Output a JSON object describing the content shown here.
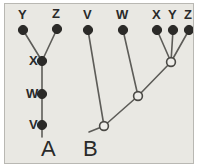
{
  "figure": {
    "background_color": "#e9e8e3",
    "border_color": "#b9b8b3",
    "line_color": "#5d5c58",
    "filled_node_color": "#2b2a28",
    "open_node_fill": "#eeede9",
    "text_color": "#2a2a2a"
  },
  "panels": [
    {
      "id": "A",
      "label": "A",
      "label_pos": {
        "x": 36,
        "y": 152
      },
      "type": "ladder-tree-filled-nodes",
      "tips": [
        {
          "name": "Y",
          "label": "Y",
          "x": 18,
          "y": 26,
          "label_x": 13,
          "label_y": 15,
          "node": "filled"
        },
        {
          "name": "Z",
          "label": "Z",
          "x": 52,
          "y": 25,
          "label_x": 47,
          "label_y": 14,
          "node": "filled"
        }
      ],
      "internal_nodes": [
        {
          "name": "X",
          "label": "X",
          "x": 37,
          "y": 57,
          "label_x": 24,
          "label_y": 61,
          "node": "filled"
        },
        {
          "name": "W",
          "label": "W",
          "x": 37,
          "y": 90,
          "label_x": 21,
          "label_y": 94,
          "node": "filled"
        },
        {
          "name": "V",
          "label": "V",
          "x": 37,
          "y": 121,
          "label_x": 24,
          "label_y": 125,
          "node": "filled"
        }
      ],
      "branches": [
        {
          "from": "Y",
          "to": "X",
          "x1": 18,
          "y1": 26,
          "x2": 37,
          "y2": 57
        },
        {
          "from": "Z",
          "to": "X",
          "x1": 52,
          "y1": 25,
          "x2": 37,
          "y2": 57
        },
        {
          "from": "X",
          "to": "W",
          "x1": 37,
          "y1": 57,
          "x2": 37,
          "y2": 90
        },
        {
          "from": "W",
          "to": "V",
          "x1": 37,
          "y1": 90,
          "x2": 37,
          "y2": 121
        },
        {
          "from": "V",
          "to": "root-stub",
          "x1": 37,
          "y1": 121,
          "x2": 37,
          "y2": 133
        }
      ]
    },
    {
      "id": "B",
      "label": "B",
      "label_pos": {
        "x": 78,
        "y": 152
      },
      "type": "ladder-tree-open-internal-nodes",
      "tips": [
        {
          "name": "V",
          "label": "V",
          "x": 83,
          "y": 26,
          "label_x": 78,
          "label_y": 15,
          "node": "filled"
        },
        {
          "name": "W",
          "label": "W",
          "x": 118,
          "y": 26,
          "label_x": 111,
          "label_y": 15,
          "node": "filled"
        },
        {
          "name": "X",
          "label": "X",
          "x": 152,
          "y": 26,
          "label_x": 147,
          "label_y": 15,
          "node": "filled"
        },
        {
          "name": "Y",
          "label": "Y",
          "x": 168,
          "y": 26,
          "label_x": 163,
          "label_y": 15,
          "node": "filled"
        },
        {
          "name": "Z",
          "label": "Z",
          "x": 184,
          "y": 26,
          "label_x": 179,
          "label_y": 15,
          "node": "filled"
        }
      ],
      "internal_nodes": [
        {
          "name": "node-xyz",
          "x": 166,
          "y": 58,
          "node": "open"
        },
        {
          "name": "node-wxyz",
          "x": 133,
          "y": 92,
          "node": "open"
        },
        {
          "name": "node-vwxyz",
          "x": 99,
          "y": 122,
          "node": "open"
        }
      ],
      "branches": [
        {
          "from": "X",
          "to": "node-xyz",
          "x1": 152,
          "y1": 26,
          "x2": 166,
          "y2": 58
        },
        {
          "from": "Y",
          "to": "node-xyz",
          "x1": 168,
          "y1": 26,
          "x2": 166,
          "y2": 58
        },
        {
          "from": "Z",
          "to": "node-xyz",
          "x1": 184,
          "y1": 26,
          "x2": 166,
          "y2": 58
        },
        {
          "from": "node-xyz",
          "to": "node-wxyz",
          "x1": 166,
          "y1": 58,
          "x2": 133,
          "y2": 92
        },
        {
          "from": "W",
          "to": "node-wxyz",
          "x1": 118,
          "y1": 26,
          "x2": 133,
          "y2": 92
        },
        {
          "from": "node-wxyz",
          "to": "node-vwxyz",
          "x1": 133,
          "y1": 92,
          "x2": 99,
          "y2": 122
        },
        {
          "from": "V",
          "to": "node-vwxyz",
          "x1": 83,
          "y1": 26,
          "x2": 99,
          "y2": 122
        },
        {
          "from": "node-vwxyz",
          "to": "root-stub",
          "x1": 99,
          "y1": 122,
          "x2": 84,
          "y2": 128
        }
      ]
    }
  ]
}
